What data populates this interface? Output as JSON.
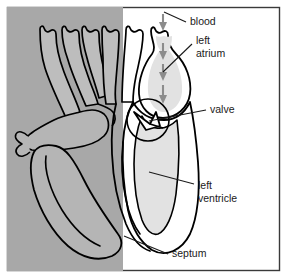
{
  "figure": {
    "name": "heart-cross-section-diagram",
    "width": 287,
    "height": 279
  },
  "colors": {
    "background": "#ffffff",
    "frame_border": "#3a3a3a",
    "shaded_half": "#a8a8a8",
    "unshaded_half": "#ffffff",
    "chamber_fill": "#e2e2e2",
    "vessel_fill_shaded": "#b5b5b5",
    "outline": "#000000",
    "arrow": "#8c8c8c",
    "label_text": "#1a1a1a",
    "leader_line": "#1a1a1a"
  },
  "labels": [
    {
      "id": "blood",
      "text": "blood",
      "lines": [
        "blood"
      ],
      "x": 190,
      "y": 22
    },
    {
      "id": "left-atrium",
      "text": "left atrium",
      "lines": [
        "left",
        "atrium"
      ],
      "x": 196,
      "y": 41
    },
    {
      "id": "valve",
      "text": "valve",
      "lines": [
        "valve"
      ],
      "x": 210,
      "y": 110
    },
    {
      "id": "left-ventricle",
      "text": "left ventricle",
      "lines": [
        "left",
        "ventricle"
      ],
      "x": 198,
      "y": 186
    },
    {
      "id": "septum",
      "text": "septum",
      "lines": [
        "septum"
      ],
      "x": 172,
      "y": 254
    }
  ],
  "leader_lines": [
    {
      "id": "leader-blood",
      "from": [
        186,
        22
      ],
      "to": [
        164,
        12
      ]
    },
    {
      "id": "leader-left-atrium",
      "from": [
        192,
        44
      ],
      "to": [
        163,
        72
      ]
    },
    {
      "id": "leader-valve",
      "from": [
        206,
        110
      ],
      "to": [
        149,
        121
      ]
    },
    {
      "id": "leader-left-ventricle",
      "from": [
        194,
        184
      ],
      "to": [
        149,
        172
      ]
    },
    {
      "id": "leader-septum",
      "from": [
        168,
        254
      ],
      "to": [
        124,
        236
      ]
    }
  ],
  "flow_arrows": {
    "name": "blood-flow-arrows",
    "direction": "down",
    "count": 3,
    "points": [
      {
        "x": 163,
        "y1": 43,
        "y2": 58
      },
      {
        "x": 163,
        "y1": 64,
        "y2": 79
      },
      {
        "x": 163,
        "y1": 85,
        "y2": 102
      }
    ]
  },
  "regions": [
    {
      "id": "shaded-right-side-of-heart",
      "description": "grey shaded left portion of image (anatomical right side of heart)"
    },
    {
      "id": "unshaded-left-side-of-heart",
      "description": "white portion of image (anatomical left side of heart)"
    },
    {
      "id": "left-atrium-chamber",
      "description": "upper light grey chamber"
    },
    {
      "id": "left-ventricle-chamber",
      "description": "lower large light grey chamber"
    },
    {
      "id": "valve-flaps",
      "description": "valve between atrium and ventricle"
    },
    {
      "id": "septum-wall",
      "description": "dividing muscular wall"
    },
    {
      "id": "great-vessels",
      "description": "branching vessels at top of heart"
    }
  ]
}
